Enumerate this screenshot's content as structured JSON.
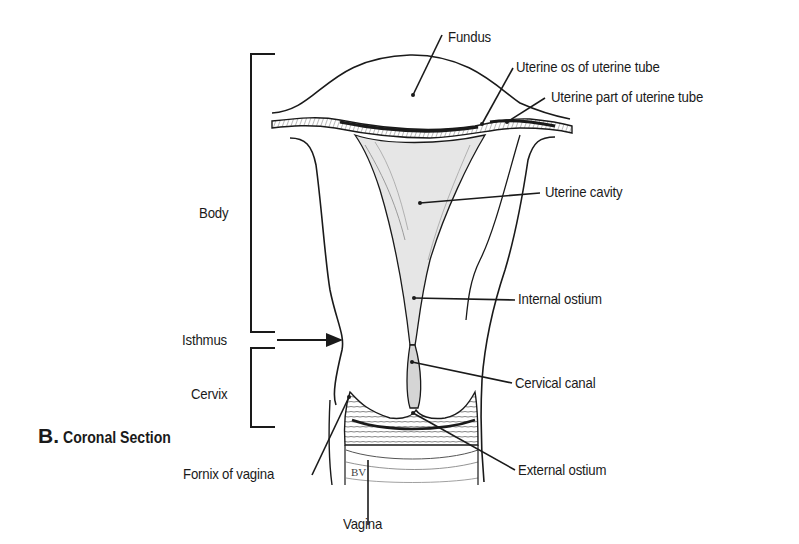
{
  "figure": {
    "panel_letter": "B.",
    "panel_title": "Coronal Section",
    "colors": {
      "ink": "#1a1a1a",
      "cavity_fill": "#e6e6e6",
      "background": "#ffffff"
    }
  },
  "regions": {
    "body": "Body",
    "isthmus": "Isthmus",
    "cervix": "Cervix"
  },
  "labels": {
    "fundus": "Fundus",
    "uterine_os": "Uterine os of uterine tube",
    "uterine_part": "Uterine part of uterine tube",
    "uterine_cavity": "Uterine cavity",
    "internal_ostium": "Internal ostium",
    "cervical_canal": "Cervical canal",
    "external_ostium": "External ostium",
    "fornix": "Fornix of vagina",
    "vagina": "Vagina"
  },
  "artist_mark": "BV"
}
